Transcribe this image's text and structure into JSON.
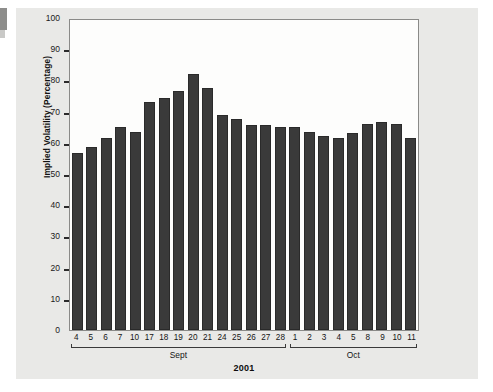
{
  "chart_data": {
    "type": "bar",
    "title": "",
    "subtitle": "",
    "xlabel": "2001",
    "ylabel": "Implied Volatility (Percentage)",
    "ylim": [
      0,
      100
    ],
    "ytick_labels": [
      "100",
      "90",
      "80",
      "70",
      "60",
      "50",
      "40",
      "30",
      "20",
      "10",
      "0"
    ],
    "ytick_values": [
      100,
      90,
      80,
      70,
      60,
      50,
      40,
      30,
      20,
      10,
      0
    ],
    "grid": false,
    "legend": null,
    "bar_color": "#3a3a3a",
    "plot_background": "#fdfdfc",
    "figure_background": "#e9e9e7",
    "categories": [
      "4",
      "5",
      "6",
      "7",
      "10",
      "17",
      "18",
      "19",
      "20",
      "21",
      "24",
      "25",
      "26",
      "27",
      "28",
      "1",
      "2",
      "3",
      "4",
      "5",
      "8",
      "9",
      "10",
      "11"
    ],
    "values": [
      57,
      59,
      62,
      65.5,
      64,
      73.5,
      75,
      77,
      82.5,
      78,
      69.5,
      68,
      66,
      66,
      65.5,
      65.5,
      64,
      62.5,
      62,
      63.5,
      66.5,
      67,
      66.5,
      62
    ],
    "groups": [
      {
        "label": "Sept",
        "start_index": 0,
        "count": 15
      },
      {
        "label": "Oct",
        "start_index": 15,
        "count": 9
      }
    ]
  }
}
